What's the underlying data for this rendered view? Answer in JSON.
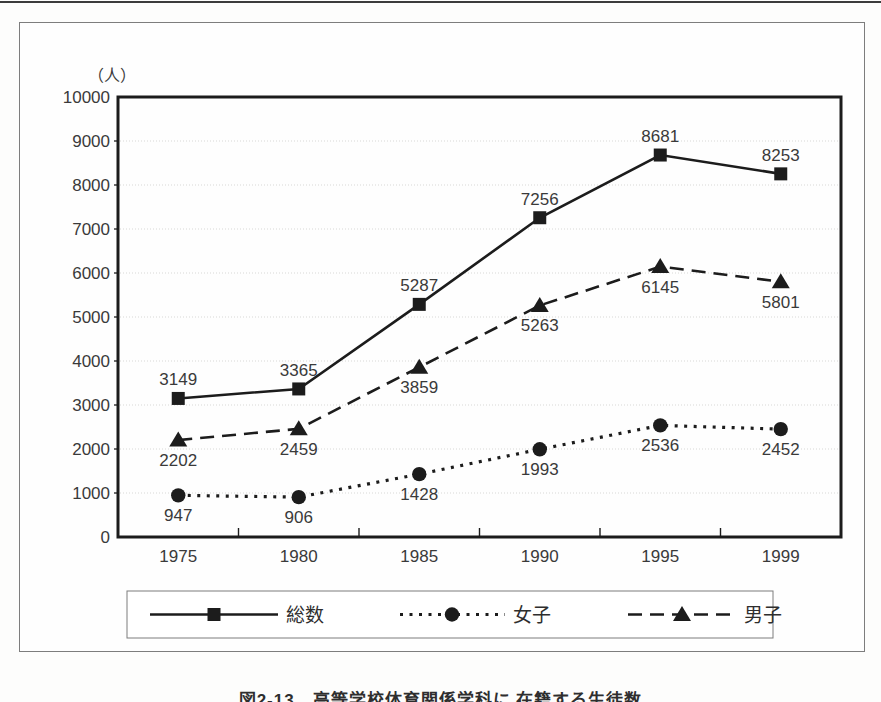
{
  "page": {
    "caption": "図2-13　高等学校体育関係学科に 在籍する生徒数"
  },
  "chart_data": {
    "type": "line",
    "unit_label": "（人）",
    "categories": [
      "1975",
      "1980",
      "1985",
      "1990",
      "1995",
      "1999"
    ],
    "ylim": [
      0,
      10000
    ],
    "ytick_step": 1000,
    "grid": "horizontal-light",
    "legend_position": "bottom-boxed",
    "series": [
      {
        "name": "総数",
        "line_style": "solid",
        "marker": "square",
        "values": [
          3149,
          3365,
          5287,
          7256,
          8681,
          8253
        ],
        "label_position": "above"
      },
      {
        "name": "女子",
        "line_style": "dotted",
        "marker": "circle",
        "values": [
          947,
          906,
          1428,
          1993,
          2536,
          2452
        ],
        "label_position": "below"
      },
      {
        "name": "男子",
        "line_style": "dashed",
        "marker": "triangle",
        "values": [
          2202,
          2459,
          3859,
          5263,
          6145,
          5801
        ],
        "label_position": "below"
      }
    ],
    "colors": {
      "ink": "#1c1c1c",
      "text": "#3a3a3a",
      "grid": "#d8d8d6",
      "frame": "#1c1c1c",
      "box_border": "#7d7d7d"
    }
  }
}
